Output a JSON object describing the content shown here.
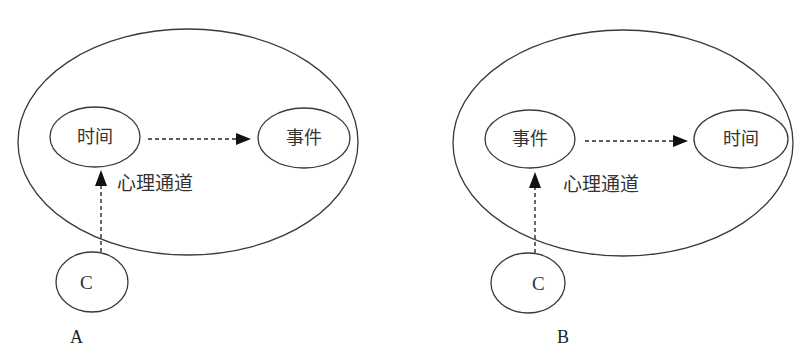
{
  "diagrams": [
    {
      "id": "A",
      "panel_label": "A",
      "outer_ellipse": {
        "cx": 188,
        "cy": 142,
        "rx": 170,
        "ry": 113
      },
      "nodes": [
        {
          "label": "时间",
          "cx": 95,
          "cy": 137,
          "rx": 45,
          "ry": 30
        },
        {
          "label": "事件",
          "cx": 304,
          "cy": 138,
          "rx": 46,
          "ry": 30
        }
      ],
      "horizontal_arrow": {
        "x1": 148,
        "x2": 250,
        "y": 139
      },
      "vertical_arrow": {
        "x": 101,
        "y1": 253,
        "y2": 170
      },
      "channel_label": "心理通道",
      "channel_label_pos": {
        "x": 117,
        "y": 190
      },
      "c_node": {
        "label": "C",
        "cx": 92,
        "cy": 282,
        "rx": 36,
        "ry": 30
      },
      "panel_label_pos": {
        "x": 77,
        "y": 343
      }
    },
    {
      "id": "B",
      "panel_label": "B",
      "outer_ellipse": {
        "cx": 623,
        "cy": 143,
        "rx": 170,
        "ry": 113
      },
      "nodes": [
        {
          "label": "事件",
          "cx": 530,
          "cy": 139,
          "rx": 45,
          "ry": 29
        },
        {
          "label": "时间",
          "cx": 741,
          "cy": 139,
          "rx": 47,
          "ry": 29
        }
      ],
      "horizontal_arrow": {
        "x1": 585,
        "x2": 688,
        "y": 141
      },
      "vertical_arrow": {
        "x": 535,
        "y1": 254,
        "y2": 172
      },
      "channel_label": "心理通道",
      "channel_label_pos": {
        "x": 563,
        "y": 191
      },
      "c_node": {
        "label": "C",
        "cx": 528,
        "cy": 283,
        "rx": 37,
        "ry": 30
      },
      "panel_label_pos": {
        "x": 563,
        "y": 343
      }
    }
  ],
  "colors": {
    "stroke": "#3a3a3a",
    "text": "#333333",
    "background": "#ffffff"
  }
}
